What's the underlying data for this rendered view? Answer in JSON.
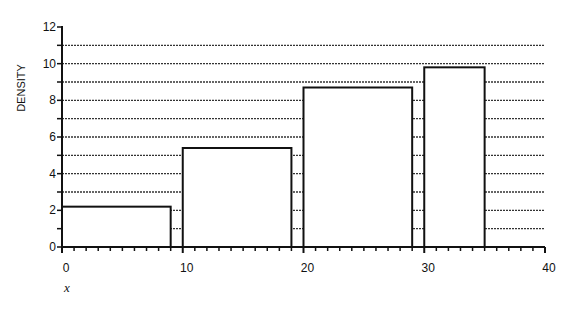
{
  "chart_data": {
    "type": "bar",
    "subtype": "histogram",
    "title": "",
    "xlabel": "x",
    "ylabel": "DENSITY",
    "xlim": [
      0,
      40
    ],
    "ylim": [
      0,
      12
    ],
    "x_ticks": [
      0,
      10,
      20,
      30,
      40
    ],
    "y_ticks": [
      0,
      2,
      4,
      6,
      8,
      10,
      12
    ],
    "grid": "horizontal dotted lines at every integer 1-11",
    "bars": [
      {
        "x_start": 0,
        "x_end": 9,
        "value": 2.2
      },
      {
        "x_start": 10,
        "x_end": 19,
        "value": 5.4
      },
      {
        "x_start": 20,
        "x_end": 29,
        "value": 8.7
      },
      {
        "x_start": 30,
        "x_end": 35,
        "value": 9.8
      }
    ],
    "categories": [
      "0-9",
      "10-19",
      "20-29",
      "30-35"
    ],
    "values": [
      2.2,
      5.4,
      8.7,
      9.8
    ],
    "legend": null
  },
  "labels": {
    "ylabel": "DENSITY",
    "xlabel": "x",
    "x_ticks": [
      "0",
      "10",
      "20",
      "30",
      "40"
    ],
    "y_ticks": [
      "0",
      "2",
      "4",
      "6",
      "8",
      "10",
      "12"
    ]
  }
}
